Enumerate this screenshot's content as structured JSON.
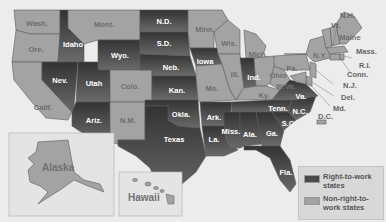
{
  "map": {
    "title": "",
    "colors": {
      "right_to_work": "#4a4a4a",
      "non_right_to_work": "#a3a3a3",
      "background": "#ececec",
      "water": "#f2f2f2"
    },
    "right_to_work_states": [
      "Idaho",
      "Nev.",
      "Utah",
      "Ariz.",
      "Wyo.",
      "N.D.",
      "S.D.",
      "Neb.",
      "Kan.",
      "Okla.",
      "Texas",
      "Iowa",
      "Ark.",
      "La.",
      "Miss.",
      "Ala.",
      "Tenn.",
      "Ga.",
      "Fla.",
      "S.C.",
      "N.C.",
      "Va.",
      "Ind."
    ],
    "non_right_to_work_states": [
      "Wash.",
      "Ore.",
      "Calif.",
      "Mont.",
      "Colo.",
      "N.M.",
      "Minn.",
      "Wis.",
      "Mich.",
      "Ill.",
      "Mo.",
      "Ohio",
      "Ky.",
      "W.Va.",
      "Pa.",
      "N.Y.",
      "Vt.",
      "N.H.",
      "Maine",
      "Mass.",
      "R.I.",
      "Conn.",
      "N.J.",
      "Del.",
      "Md.",
      "D.C.",
      "Alaska",
      "Hawaii"
    ],
    "labels": {
      "wash": "Wash.",
      "ore": "Ore.",
      "calif": "Calif.",
      "idaho": "Idaho",
      "nev": "Nev.",
      "mont": "Mont.",
      "wyo": "Wyo.",
      "utah": "Utah",
      "colo": "Colo.",
      "ariz": "Ariz.",
      "nm": "N.M.",
      "nd": "N.D.",
      "sd": "S.D.",
      "neb": "Neb.",
      "kan": "Kan.",
      "okla": "Okla.",
      "texas": "Texas",
      "minn": "Minn.",
      "iowa": "Iowa",
      "mo": "Mo.",
      "ark": "Ark.",
      "la": "La.",
      "wis": "Wis.",
      "ill": "Ill.",
      "mich": "Mich.",
      "ind": "Ind.",
      "ohio": "Ohio",
      "ky": "Ky.",
      "tenn": "Tenn.",
      "miss": "Miss.",
      "ala": "Ala.",
      "ga": "Ga.",
      "fla": "Fla.",
      "sc": "S.C.",
      "nc": "N.C.",
      "va": "Va.",
      "wva": "W.Va.",
      "pa": "Pa.",
      "ny": "N.Y.",
      "vt": "Vt.",
      "nh": "N.H.",
      "maine": "Maine",
      "mass": "Mass.",
      "ri": "R.I.",
      "conn": "Conn.",
      "nj": "N.J.",
      "del": "Del.",
      "md": "Md.",
      "dc": "D.C.",
      "alaska": "Alaska",
      "hawaii": "Hawaii"
    }
  },
  "legend": {
    "items": [
      {
        "label": "Right-to-work states",
        "color": "#4a4a4a"
      },
      {
        "label": "Non-right-to-work states",
        "color": "#a3a3a3"
      }
    ]
  }
}
